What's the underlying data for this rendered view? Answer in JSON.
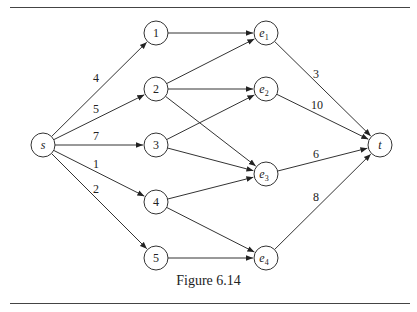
{
  "figure": {
    "caption": "Figure 6.14",
    "node_radius": 12,
    "line_color": "#333333",
    "nodes": [
      {
        "id": "s",
        "label": "s",
        "sub": "",
        "italic": true,
        "x": 43,
        "y": 145
      },
      {
        "id": "1",
        "label": "1",
        "sub": "",
        "italic": false,
        "x": 156,
        "y": 33
      },
      {
        "id": "2",
        "label": "2",
        "sub": "",
        "italic": false,
        "x": 156,
        "y": 89
      },
      {
        "id": "3",
        "label": "3",
        "sub": "",
        "italic": false,
        "x": 156,
        "y": 145
      },
      {
        "id": "4",
        "label": "4",
        "sub": "",
        "italic": false,
        "x": 156,
        "y": 202
      },
      {
        "id": "5",
        "label": "5",
        "sub": "",
        "italic": false,
        "x": 156,
        "y": 258
      },
      {
        "id": "e1",
        "label": "e",
        "sub": "1",
        "italic": true,
        "x": 266,
        "y": 33
      },
      {
        "id": "e2",
        "label": "e",
        "sub": "2",
        "italic": true,
        "x": 266,
        "y": 89
      },
      {
        "id": "e3",
        "label": "e",
        "sub": "3",
        "italic": true,
        "x": 266,
        "y": 174
      },
      {
        "id": "e4",
        "label": "e",
        "sub": "4",
        "italic": true,
        "x": 266,
        "y": 258
      },
      {
        "id": "t",
        "label": "t",
        "sub": "",
        "italic": true,
        "x": 380,
        "y": 145
      }
    ],
    "edges": [
      {
        "from": "s",
        "to": "1",
        "weight": "4",
        "lx": 96,
        "ly": 82
      },
      {
        "from": "s",
        "to": "2",
        "weight": "5",
        "lx": 96,
        "ly": 113
      },
      {
        "from": "s",
        "to": "3",
        "weight": "7",
        "lx": 96,
        "ly": 140
      },
      {
        "from": "s",
        "to": "4",
        "weight": "1",
        "lx": 96,
        "ly": 168
      },
      {
        "from": "s",
        "to": "5",
        "weight": "2",
        "lx": 96,
        "ly": 193
      },
      {
        "from": "1",
        "to": "e1",
        "weight": "",
        "lx": 0,
        "ly": 0
      },
      {
        "from": "2",
        "to": "e1",
        "weight": "",
        "lx": 0,
        "ly": 0
      },
      {
        "from": "2",
        "to": "e2",
        "weight": "",
        "lx": 0,
        "ly": 0
      },
      {
        "from": "2",
        "to": "e3",
        "weight": "",
        "lx": 0,
        "ly": 0
      },
      {
        "from": "3",
        "to": "e2",
        "weight": "",
        "lx": 0,
        "ly": 0
      },
      {
        "from": "3",
        "to": "e3",
        "weight": "",
        "lx": 0,
        "ly": 0
      },
      {
        "from": "4",
        "to": "e3",
        "weight": "",
        "lx": 0,
        "ly": 0
      },
      {
        "from": "4",
        "to": "e4",
        "weight": "",
        "lx": 0,
        "ly": 0
      },
      {
        "from": "5",
        "to": "e4",
        "weight": "",
        "lx": 0,
        "ly": 0
      },
      {
        "from": "e1",
        "to": "t",
        "weight": "3",
        "lx": 316,
        "ly": 78
      },
      {
        "from": "e2",
        "to": "t",
        "weight": "10",
        "lx": 317,
        "ly": 109
      },
      {
        "from": "e3",
        "to": "t",
        "weight": "6",
        "lx": 316,
        "ly": 158
      },
      {
        "from": "e4",
        "to": "t",
        "weight": "8",
        "lx": 316,
        "ly": 201
      }
    ]
  }
}
